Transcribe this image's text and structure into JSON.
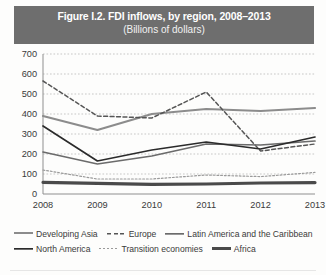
{
  "figure": {
    "title": "Figure I.2. FDI inflows, by region, 2008–2013",
    "subtitle": "(Billions of dollars)",
    "title_band_color": "#6e6e6e",
    "title_text_color": "#ffffff"
  },
  "legend": {
    "rows": [
      [
        {
          "label": "Developing Asia",
          "color": "#8c8c8c",
          "style": "solid",
          "width": 2.2
        },
        {
          "label": "Europe",
          "color": "#555555",
          "style": "dashed",
          "width": 1.5
        },
        {
          "label": "Latin America and the Caribbean",
          "color": "#6b6b6b",
          "style": "solid",
          "width": 1.7
        }
      ],
      [
        {
          "label": "North America",
          "color": "#2b2b2b",
          "style": "solid",
          "width": 1.7
        },
        {
          "label": "Transition economies",
          "color": "#9a9a9a",
          "style": "dotted",
          "width": 1.2
        },
        {
          "label": "Africa",
          "color": "#4a4a4a",
          "style": "solid",
          "width": 3.2
        }
      ]
    ]
  },
  "chart_data": {
    "type": "line",
    "title": "Figure I.2. FDI inflows, by region, 2008–2013",
    "subtitle": "(Billions of dollars)",
    "xlabel": "",
    "ylabel": "Billions of dollars",
    "categories": [
      "2008",
      "2009",
      "2010",
      "2011",
      "2012",
      "2013"
    ],
    "x": [
      2008,
      2009,
      2010,
      2011,
      2012,
      2013
    ],
    "ylim": [
      0,
      700
    ],
    "yticks": [
      0,
      100,
      200,
      300,
      400,
      500,
      600,
      700
    ],
    "grid": "horizontal-dotted",
    "legend_position": "bottom",
    "series": [
      {
        "name": "Developing Asia",
        "color": "#8c8c8c",
        "style": "solid",
        "width": 2.2,
        "values": [
          390,
          320,
          400,
          425,
          415,
          430
        ]
      },
      {
        "name": "Europe",
        "color": "#555555",
        "style": "dashed",
        "width": 1.5,
        "values": [
          565,
          390,
          380,
          510,
          215,
          250
        ]
      },
      {
        "name": "Latin America and the Caribbean",
        "color": "#6b6b6b",
        "style": "solid",
        "width": 1.7,
        "values": [
          210,
          150,
          190,
          250,
          245,
          265
        ]
      },
      {
        "name": "North America",
        "color": "#2b2b2b",
        "style": "solid",
        "width": 1.7,
        "values": [
          340,
          165,
          220,
          260,
          225,
          285
        ]
      },
      {
        "name": "Transition economies",
        "color": "#9a9a9a",
        "style": "dotted",
        "width": 1.2,
        "values": [
          120,
          75,
          75,
          95,
          87,
          108
        ]
      },
      {
        "name": "Africa",
        "color": "#4a4a4a",
        "style": "solid",
        "width": 3.2,
        "values": [
          58,
          53,
          48,
          50,
          55,
          57
        ]
      }
    ]
  }
}
